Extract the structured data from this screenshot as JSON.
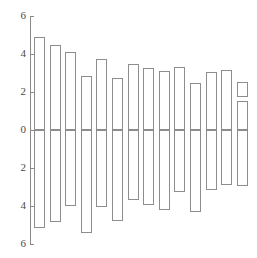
{
  "chart_data": {
    "type": "bar",
    "title": "",
    "subtitle": "",
    "xlabel": "",
    "ylabel": "",
    "grid": false,
    "legend": false,
    "legend_position": "none",
    "orientation": "vertical",
    "bar_style": "outline-only",
    "bar_fill_color": "#ffffff",
    "bar_edge_color": "#8d8d8d",
    "axis_color": "#8a8a8a",
    "background_color": "#ffffff",
    "xaxis_visible": false,
    "x_tick_labels": [],
    "ylim": [
      -6,
      6
    ],
    "ytick_values": [
      6,
      4,
      2,
      0,
      -2,
      -4,
      -6
    ],
    "ytick_labels": [
      "6",
      "4",
      "2",
      "0",
      "2",
      "4",
      "6"
    ],
    "categories": [
      "1",
      "2",
      "3",
      "4",
      "5",
      "6",
      "7",
      "8",
      "9",
      "10",
      "11",
      "12",
      "13",
      "14"
    ],
    "series": [
      {
        "name": "positive",
        "values": [
          4.9,
          4.45,
          4.1,
          2.85,
          3.75,
          2.75,
          3.45,
          3.25,
          3.1,
          3.3,
          2.5,
          3.05,
          3.15,
          2.55
        ]
      },
      {
        "name": "negative",
        "values": [
          -5.15,
          -4.85,
          -4.0,
          -5.4,
          -4.05,
          -4.8,
          -3.7,
          -3.95,
          -4.2,
          -3.25,
          -4.3,
          -3.15,
          -2.9,
          -2.95
        ]
      }
    ]
  },
  "split_bar": {
    "index": 13,
    "upper_segment": [
      1.75,
      2.55
    ],
    "lower_segment": [
      0.0,
      1.55
    ]
  },
  "geometry": {
    "zero_y": 130,
    "px_per_unit": 19.0,
    "first_bar_x": 34,
    "bar_pitch": 15.6,
    "bar_width": 11
  }
}
